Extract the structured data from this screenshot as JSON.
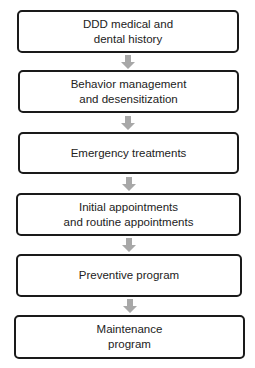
{
  "flowchart": {
    "steps": [
      {
        "label": "DDD medical and\ndental history"
      },
      {
        "label": "Behavior management\nand desensitization"
      },
      {
        "label": "Emergency treatments"
      },
      {
        "label": "Initial appointments\nand routine appointments"
      },
      {
        "label": "Preventive program"
      },
      {
        "label": "Maintenance\nprogram"
      }
    ],
    "arrow_color": "#a8a8a8",
    "border_color": "#1a1a1a"
  }
}
